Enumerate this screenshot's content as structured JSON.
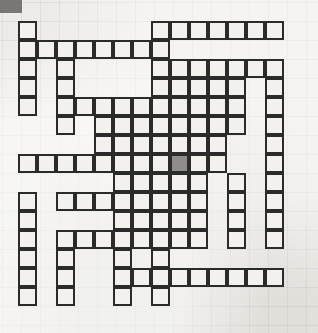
{
  "puzzle": {
    "kind": "crossword-grid",
    "title": "Crossword puzzle grid",
    "columns": 14,
    "rows": 15,
    "cell_size_px": 19,
    "origin_x_px": 18,
    "origin_y_px": 21,
    "colors": {
      "page_background": "#edebe7",
      "cell_fill": "#f2f1ed",
      "cell_border": "#2b2b2b",
      "shaded_cell_fill": "#8e8d89",
      "corner_smudge": "#6f6d69"
    },
    "shaded_cells": [
      {
        "row": 7,
        "col": 8
      }
    ],
    "filled_rows": [
      {
        "row": 0,
        "cols": [
          0,
          7,
          8,
          9,
          10,
          11,
          12,
          13
        ]
      },
      {
        "row": 1,
        "cols": [
          0,
          1,
          2,
          3,
          4,
          5,
          6,
          7
        ]
      },
      {
        "row": 2,
        "cols": [
          0,
          2,
          7,
          8,
          9,
          10,
          11,
          12,
          13
        ]
      },
      {
        "row": 3,
        "cols": [
          0,
          2,
          7,
          8,
          9,
          10,
          11,
          13
        ]
      },
      {
        "row": 4,
        "cols": [
          0,
          2,
          3,
          4,
          5,
          6,
          7,
          8,
          9,
          10,
          11,
          13
        ]
      },
      {
        "row": 5,
        "cols": [
          2,
          4,
          5,
          6,
          7,
          8,
          9,
          10,
          11,
          13
        ]
      },
      {
        "row": 6,
        "cols": [
          4,
          5,
          6,
          7,
          8,
          9,
          10,
          13
        ]
      },
      {
        "row": 7,
        "cols": [
          0,
          1,
          2,
          3,
          4,
          5,
          6,
          7,
          8,
          9,
          10,
          13
        ]
      },
      {
        "row": 8,
        "cols": [
          5,
          6,
          7,
          8,
          9,
          11,
          13
        ]
      },
      {
        "row": 9,
        "cols": [
          0,
          2,
          3,
          4,
          5,
          6,
          7,
          8,
          9,
          11,
          13
        ]
      },
      {
        "row": 10,
        "cols": [
          0,
          5,
          6,
          7,
          8,
          9,
          11,
          13
        ]
      },
      {
        "row": 11,
        "cols": [
          0,
          2,
          3,
          4,
          5,
          6,
          7,
          8,
          9,
          11,
          13
        ]
      },
      {
        "row": 12,
        "cols": [
          0,
          2,
          5,
          7
        ]
      },
      {
        "row": 13,
        "cols": [
          0,
          2,
          5,
          6,
          7,
          8,
          9,
          10,
          11,
          12,
          13
        ]
      },
      {
        "row": 14,
        "cols": [
          0,
          2,
          5,
          7
        ]
      }
    ]
  }
}
